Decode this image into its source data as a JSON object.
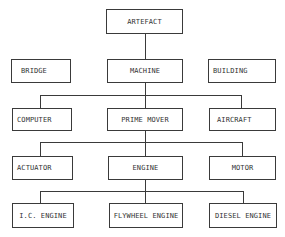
{
  "diagram": {
    "nodes": {
      "artefact": "ARTEFACT",
      "bridge": "BRIDGE",
      "machine": "MACHINE",
      "building": "BUILDING",
      "computer": "COMPUTER",
      "prime_mover": "PRIME MOVER",
      "aircraft": "AIRCRAFT",
      "actuator": "ACTUATOR",
      "engine": "ENGINE",
      "motor": "MOTOR",
      "ic_engine": "I.C. ENGINE",
      "flywheel_engine": "FLYWHEEL ENGINE",
      "diesel_engine": "DIESEL ENGINE"
    },
    "edges": [
      [
        "ARTEFACT",
        "MACHINE"
      ],
      [
        "MACHINE",
        "COMPUTER"
      ],
      [
        "MACHINE",
        "PRIME MOVER"
      ],
      [
        "MACHINE",
        "AIRCRAFT"
      ],
      [
        "PRIME MOVER",
        "ACTUATOR"
      ],
      [
        "PRIME MOVER",
        "ENGINE"
      ],
      [
        "PRIME MOVER",
        "MOTOR"
      ],
      [
        "ENGINE",
        "I.C. ENGINE"
      ],
      [
        "ENGINE",
        "FLYWHEEL ENGINE"
      ],
      [
        "ENGINE",
        "DIESEL ENGINE"
      ]
    ],
    "colors": {
      "line": "#3a3a3a",
      "text": "#333333",
      "background": "#ffffff"
    }
  }
}
